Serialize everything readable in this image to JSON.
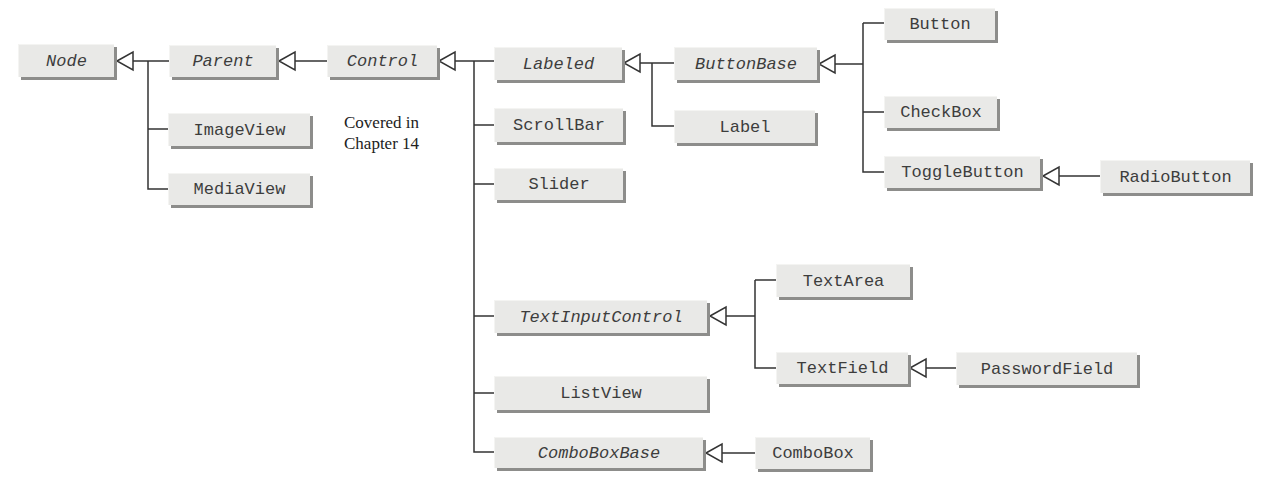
{
  "diagram": {
    "type": "uml-class-hierarchy",
    "classes": [
      {
        "id": "Node",
        "label": "Node",
        "abstract": true
      },
      {
        "id": "Parent",
        "label": "Parent",
        "abstract": true
      },
      {
        "id": "Control",
        "label": "Control",
        "abstract": true
      },
      {
        "id": "ImageView",
        "label": "ImageView",
        "abstract": false
      },
      {
        "id": "MediaView",
        "label": "MediaView",
        "abstract": false
      },
      {
        "id": "Labeled",
        "label": "Labeled",
        "abstract": true
      },
      {
        "id": "ButtonBase",
        "label": "ButtonBase",
        "abstract": true
      },
      {
        "id": "Label",
        "label": "Label",
        "abstract": false
      },
      {
        "id": "Button",
        "label": "Button",
        "abstract": false
      },
      {
        "id": "CheckBox",
        "label": "CheckBox",
        "abstract": false
      },
      {
        "id": "ToggleButton",
        "label": "ToggleButton",
        "abstract": false
      },
      {
        "id": "RadioButton",
        "label": "RadioButton",
        "abstract": false
      },
      {
        "id": "ScrollBar",
        "label": "ScrollBar",
        "abstract": false
      },
      {
        "id": "Slider",
        "label": "Slider",
        "abstract": false
      },
      {
        "id": "TextInputControl",
        "label": "TextInputControl",
        "abstract": true
      },
      {
        "id": "TextArea",
        "label": "TextArea",
        "abstract": false
      },
      {
        "id": "TextField",
        "label": "TextField",
        "abstract": false
      },
      {
        "id": "PasswordField",
        "label": "PasswordField",
        "abstract": false
      },
      {
        "id": "ListView",
        "label": "ListView",
        "abstract": false
      },
      {
        "id": "ComboBoxBase",
        "label": "ComboBoxBase",
        "abstract": true
      },
      {
        "id": "ComboBox",
        "label": "ComboBox",
        "abstract": false
      }
    ],
    "inheritance": [
      {
        "child": "Parent",
        "parent": "Node"
      },
      {
        "child": "ImageView",
        "parent": "Node"
      },
      {
        "child": "MediaView",
        "parent": "Node"
      },
      {
        "child": "Control",
        "parent": "Parent"
      },
      {
        "child": "Labeled",
        "parent": "Control"
      },
      {
        "child": "ScrollBar",
        "parent": "Control"
      },
      {
        "child": "Slider",
        "parent": "Control"
      },
      {
        "child": "TextInputControl",
        "parent": "Control"
      },
      {
        "child": "ListView",
        "parent": "Control"
      },
      {
        "child": "ComboBoxBase",
        "parent": "Control"
      },
      {
        "child": "ButtonBase",
        "parent": "Labeled"
      },
      {
        "child": "Label",
        "parent": "Labeled"
      },
      {
        "child": "Button",
        "parent": "ButtonBase"
      },
      {
        "child": "CheckBox",
        "parent": "ButtonBase"
      },
      {
        "child": "ToggleButton",
        "parent": "ButtonBase"
      },
      {
        "child": "RadioButton",
        "parent": "ToggleButton"
      },
      {
        "child": "TextArea",
        "parent": "TextInputControl"
      },
      {
        "child": "TextField",
        "parent": "TextInputControl"
      },
      {
        "child": "PasswordField",
        "parent": "TextField"
      },
      {
        "child": "ComboBox",
        "parent": "ComboBoxBase"
      }
    ],
    "note": {
      "line1": "Covered in",
      "line2": "Chapter 14"
    }
  }
}
